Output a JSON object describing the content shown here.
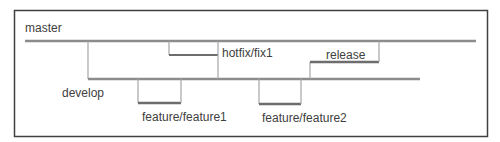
{
  "diagram": {
    "type": "git-branching-model",
    "colors": {
      "frame": "#404040",
      "main_line": "#8c8c8c",
      "branch_line": "#a6a6a6",
      "branch_accent": "#6d6d6d",
      "label": "#404040"
    },
    "branches": [
      {
        "id": "master",
        "label": "master"
      },
      {
        "id": "hotfix",
        "label": "hotfix/fix1"
      },
      {
        "id": "release",
        "label": "release"
      },
      {
        "id": "develop",
        "label": "develop"
      },
      {
        "id": "feature1",
        "label": "feature/feature1"
      },
      {
        "id": "feature2",
        "label": "feature/feature2"
      }
    ]
  }
}
